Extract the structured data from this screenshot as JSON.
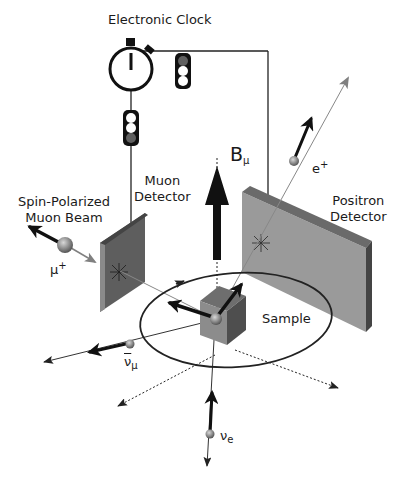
{
  "labels": {
    "electronic_clock": "Electronic Clock",
    "beam_line1": "Spin-Polarized",
    "beam_line2": "Muon Beam",
    "muon_detector_line1": "Muon",
    "muon_detector_line2": "Detector",
    "positron_detector_line1": "Positron",
    "positron_detector_line2": "Detector",
    "sample": "Sample",
    "field_base": "B",
    "field_sub": "μ",
    "muon_base": "μ",
    "muon_sup": "+",
    "positron_base": "e",
    "positron_sup": "+",
    "antineutrino_base": "ν",
    "antineutrino_sub": "μ",
    "neutrino_base": "ν",
    "neutrino_sub": "e"
  },
  "colors": {
    "detector_face": "#5e5e5e",
    "detector_edge": "#3a3a3a",
    "positron_face": "#9a9a9a",
    "positron_edge": "#5a5a5a",
    "arrow_dark": "#111111",
    "arrow_gray": "#808080",
    "line": "#222222",
    "indicator_on": "#606060"
  }
}
